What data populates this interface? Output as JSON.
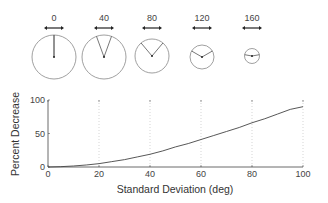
{
  "diagrams": [
    {
      "label": "0",
      "cx": 54,
      "cy": 57,
      "r": 22,
      "spread": 0
    },
    {
      "label": "40",
      "cx": 104,
      "cy": 57,
      "r": 22,
      "spread": 40
    },
    {
      "label": "80",
      "cx": 152,
      "cy": 56,
      "r": 17,
      "spread": 80
    },
    {
      "label": "120",
      "cx": 202,
      "cy": 57,
      "r": 12,
      "spread": 120
    },
    {
      "label": "160",
      "cx": 252,
      "cy": 56,
      "r": 7.5,
      "spread": 160
    }
  ],
  "chart_data": {
    "type": "line",
    "title": "",
    "xlabel": "Standard Deviation (deg)",
    "ylabel": "Percent Decrease",
    "xlim": [
      0,
      100
    ],
    "ylim": [
      0,
      100
    ],
    "x_ticks": [
      "0",
      "20",
      "40",
      "60",
      "80",
      "100"
    ],
    "y_ticks": [
      "0",
      "50",
      "100"
    ],
    "grid": "vertical dotted at 20,40,60,80,100",
    "series": [
      {
        "name": "Percent Decrease",
        "x": [
          0,
          5,
          10,
          15,
          20,
          25,
          30,
          35,
          40,
          45,
          50,
          55,
          60,
          65,
          70,
          75,
          80,
          85,
          90,
          95,
          100
        ],
        "y": [
          0,
          0.5,
          1.5,
          3,
          5,
          8,
          11,
          15,
          19,
          24,
          30,
          35,
          41,
          47,
          53,
          59,
          66,
          72,
          79,
          86,
          90
        ]
      }
    ]
  }
}
